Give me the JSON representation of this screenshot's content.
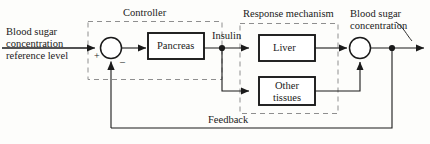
{
  "diagram": {
    "colors": {
      "line": "#1a1a1a",
      "dashed": "#8a8a8a",
      "background": "#fdfdfb",
      "block_fill": "#ffffff"
    },
    "input": {
      "label_line1": "Blood sugar",
      "label_line2": "concentration",
      "label_line3": "reference level"
    },
    "groups": [
      {
        "name": "controller",
        "label": "Controller"
      },
      {
        "name": "response-mechanism",
        "label": "Response mechanism"
      }
    ],
    "blocks": [
      {
        "name": "pancreas",
        "label": "Pancreas"
      },
      {
        "name": "liver",
        "label": "Liver"
      },
      {
        "name": "other-tissues",
        "label_line1": "Other",
        "label_line2": "tissues"
      }
    ],
    "signals": [
      {
        "name": "insulin",
        "label": "Insulin"
      },
      {
        "name": "feedback",
        "label": "Feedback"
      }
    ],
    "output": {
      "label_line1": "Blood sugar",
      "label_line2": "concentration"
    },
    "summing_junctions": [
      {
        "name": "error-junction",
        "plus_sign": "+",
        "minus_sign": "–"
      },
      {
        "name": "output-junction",
        "plus_sign": "",
        "minus_sign": ""
      }
    ]
  }
}
